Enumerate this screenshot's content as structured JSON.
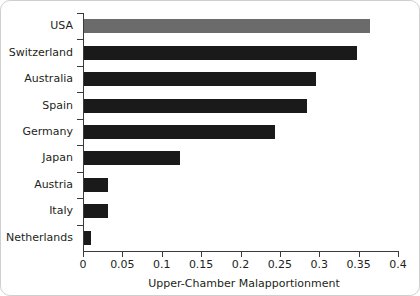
{
  "chart_data": {
    "type": "bar",
    "orientation": "horizontal",
    "title": "",
    "xlabel": "Upper-Chamber Malapportionment",
    "ylabel": "",
    "xlim": [
      0,
      0.4
    ],
    "grid": false,
    "legend": null,
    "categories": [
      "USA",
      "Switzerland",
      "Australia",
      "Spain",
      "Germany",
      "Japan",
      "Austria",
      "Italy",
      "Netherlands"
    ],
    "values": [
      0.363,
      0.347,
      0.295,
      0.283,
      0.243,
      0.122,
      0.03,
      0.03,
      0.009
    ],
    "bar_colors": [
      "#6b6b6b",
      "#1a1a1a",
      "#1a1a1a",
      "#1a1a1a",
      "#1a1a1a",
      "#1a1a1a",
      "#1a1a1a",
      "#1a1a1a",
      "#1a1a1a"
    ],
    "highlight_category": "USA",
    "highlight_color": "#6b6b6b",
    "default_bar_color": "#1a1a1a",
    "xticks": [
      0,
      0.05,
      0.1,
      0.15,
      0.2,
      0.25,
      0.3,
      0.35,
      0.4
    ],
    "xtick_labels": [
      "0",
      "0.05",
      "0.1",
      "0.15",
      "0.2",
      "0.25",
      "0.3",
      "0.35",
      "0.4"
    ],
    "axis_color": "#3a3a3a",
    "text_color": "#231f20",
    "background_color": "#ffffff",
    "frame_color": "#cfcfcf"
  }
}
